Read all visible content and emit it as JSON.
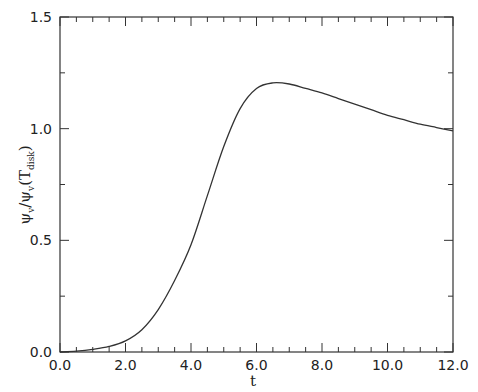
{
  "chart_data": {
    "type": "line",
    "title": "",
    "xlabel": "t",
    "ylabel": "ψ_v/ψ_v(T_disk)",
    "ylabel_parts": {
      "main": "ψ",
      "sub1": "v",
      "slash": "/",
      "main2": "ψ",
      "sub2": "v",
      "paren_open": "(",
      "T": "T",
      "sub3": "disk",
      "paren_close": ")"
    },
    "xlim": [
      0,
      12
    ],
    "ylim": [
      0,
      1.5
    ],
    "x_ticks": [
      "0.0",
      "2.0",
      "4.0",
      "6.0",
      "8.0",
      "10.0",
      "12.0"
    ],
    "y_ticks": [
      "0.0",
      "0.5",
      "1.0",
      "1.5"
    ],
    "grid": false,
    "legend": null,
    "series": [
      {
        "name": "psi_v ratio",
        "x": [
          0.0,
          0.5,
          1.0,
          1.5,
          2.0,
          2.5,
          3.0,
          3.5,
          4.0,
          4.5,
          5.0,
          5.5,
          6.0,
          6.5,
          7.0,
          7.5,
          8.0,
          8.5,
          9.0,
          9.5,
          10.0,
          10.5,
          11.0,
          11.5,
          12.0
        ],
        "y": [
          0.0,
          0.004,
          0.012,
          0.025,
          0.05,
          0.1,
          0.19,
          0.32,
          0.48,
          0.7,
          0.92,
          1.09,
          1.18,
          1.205,
          1.2,
          1.18,
          1.16,
          1.135,
          1.11,
          1.085,
          1.06,
          1.04,
          1.02,
          1.005,
          0.99
        ]
      }
    ]
  }
}
